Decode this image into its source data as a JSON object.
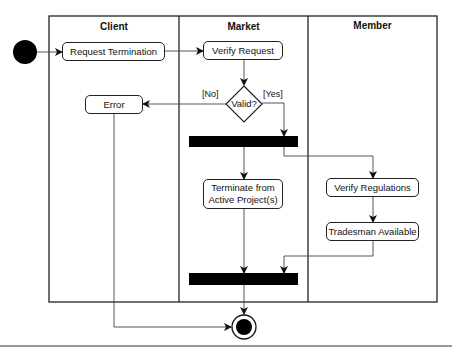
{
  "diagram": {
    "type": "uml-activity-diagram",
    "swimlanes": [
      {
        "name": "Client"
      },
      {
        "name": "Market"
      },
      {
        "name": "Member"
      }
    ],
    "nodes": {
      "request_termination": "Request Termination",
      "verify_request": "Verify Request",
      "valid_decision": "Valid?",
      "error": "Error",
      "terminate_active_line1": "Terminate from",
      "terminate_active_line2": "Active Project(s)",
      "verify_regulations": "Verify Regulations",
      "tradesman_available": "Tradesman Available"
    },
    "guards": {
      "no": "[No]",
      "yes": "[Yes]"
    },
    "colors": {
      "line": "#222222",
      "fill": "#000000",
      "background": "#ffffff"
    }
  }
}
